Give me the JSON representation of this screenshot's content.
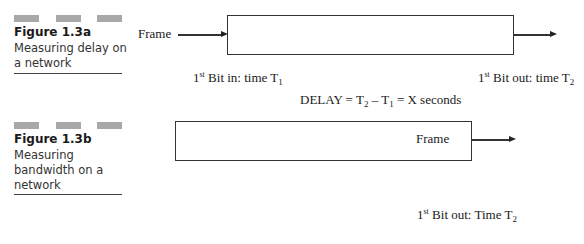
{
  "figure_a": {
    "caption_title": "Figure 1.3a",
    "caption_line1": "Measuring delay on",
    "caption_line2": "a network",
    "input_label": "Frame",
    "first_bit_in": {
      "ord": "1",
      "sup": "st",
      "text": " Bit in: time T",
      "sub": "1"
    },
    "first_bit_out": {
      "ord": "1",
      "sup": "st",
      "text": " Bit out: time T",
      "sub": "2"
    },
    "delay": {
      "prefix": "DELAY = T",
      "sub1": "2",
      "mid": " – T",
      "sub2": "1",
      "suffix": " = X seconds"
    }
  },
  "figure_b": {
    "caption_title": "Figure 1.3b",
    "caption_line1": "Measuring",
    "caption_line2": "bandwidth on a",
    "caption_line3": "network",
    "box_label": "Frame",
    "first_bit_out": {
      "ord": "1",
      "sup": "st",
      "text": " Bit out: Time T",
      "sub": "2"
    }
  },
  "colors": {
    "decor_bar": "#a8a8a8",
    "line": "#333333"
  }
}
